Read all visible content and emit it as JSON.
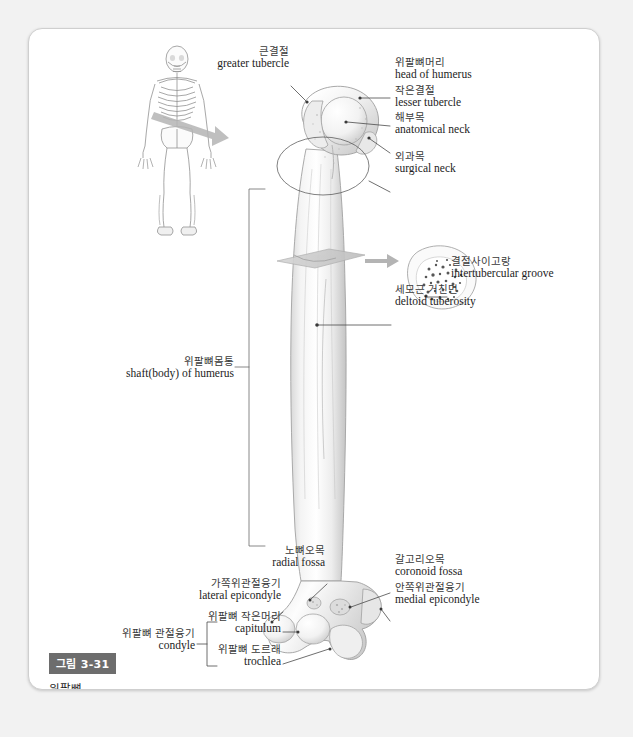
{
  "figure": {
    "badge": "그림 3-31",
    "title": "위팔뼈",
    "subject": "humerus"
  },
  "labels": {
    "greater_tubercle": {
      "ko": "큰결절",
      "en": "greater tubercle"
    },
    "head_of_humerus": {
      "ko": "위팔뼈머리",
      "en": "head of humerus"
    },
    "lesser_tubercle": {
      "ko": "작은결절",
      "en": "lesser tubercle"
    },
    "anatomical_neck": {
      "ko": "해부목",
      "en": "anatomical neck"
    },
    "surgical_neck": {
      "ko": "외과목",
      "en": "surgical neck"
    },
    "intertubercular": {
      "ko": "결절사이고랑",
      "en": "intertubercular groove"
    },
    "deltoid_tuberosity": {
      "ko": "세모근 거친면",
      "en": "deltoid tuberosity"
    },
    "shaft_of_humerus": {
      "ko": "위팔뼈몸통",
      "en": "shaft(body) of humerus"
    },
    "radial_fossa": {
      "ko": "노뼈오목",
      "en": "radial fossa"
    },
    "lateral_epicondyle": {
      "ko": "가쪽위관절융기",
      "en": "lateral epicondyle"
    },
    "capitulum": {
      "ko": "위팔뼈 작은머리",
      "en": "capitulum"
    },
    "trochlea": {
      "ko": "위팔뼈 도르래",
      "en": "trochlea"
    },
    "condyle": {
      "ko": "위팔뼈 관절융기",
      "en": "condyle"
    },
    "coronoid_fossa": {
      "ko": "갈고리오목",
      "en": "coronoid fossa"
    },
    "medial_epicondyle": {
      "ko": "안쪽위관절융기",
      "en": "medial epicondyle"
    }
  },
  "colors": {
    "page_background": "#f2f2f2",
    "card_background": "#ffffff",
    "card_border": "#cfcfcf",
    "badge_background": "#6d6d6d",
    "badge_text": "#ffffff",
    "leader_line": "#4a4a4a",
    "bone_outline": "#9a9a9a",
    "bone_fill": "#f7f7f7",
    "arrow_gray": "#b4b4b4",
    "cutplane_gray": "#c9c9c9",
    "skeleton_line": "#8d8d8d"
  },
  "graphics": {
    "skeleton_inset": "anterior full-body skeleton line drawing with gray arrow indicating the right humerus",
    "main_bone": "anterior view of right humerus, shaded pencil rendering",
    "cross_section": "transverse cross-section of the humeral shaft showing spongy/trabecular bone",
    "cut_plane": "gray parallelogram indicating the transverse section level"
  }
}
